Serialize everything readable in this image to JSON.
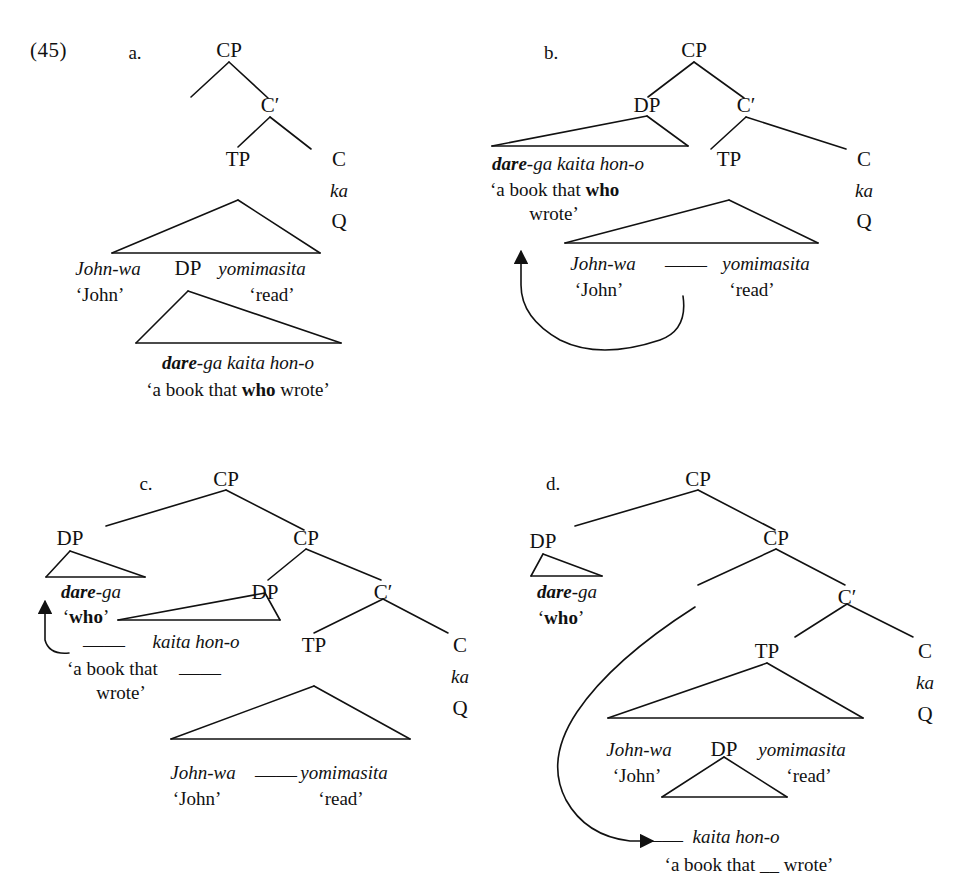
{
  "figure": {
    "number": "(45)",
    "caption_present": false
  },
  "labels": {
    "cp": "CP",
    "cbar": "C′",
    "tp": "TP",
    "c": "C",
    "dp": "DP",
    "ka": "ka",
    "q": "Q",
    "gap": "——"
  },
  "glosses": {
    "john_wa": "John-wa",
    "john": "‘John’",
    "yomimasita": "yomimasita",
    "read": "‘read’",
    "dare_ga_kaita_hon_o": "dare-ga kaita hon-o",
    "dare": "dare",
    "ga_kaita_hon_o": "-ga kaita hon-o",
    "book_that_who_wrote": "‘a book that who wrote’",
    "book_that_who": "‘a book that who",
    "wrote": "wrote’",
    "dare_ga": "-ga",
    "who_q": "‘who’",
    "who": "who",
    "kaita_hon_o": "kaita hon-o",
    "book_that_gap": "‘a book that",
    "gap_wrote": "wrote’",
    "book_that_gap_wrote": "‘a book that __ wrote’"
  },
  "trees": [
    {
      "id": "a",
      "letter": "a.",
      "description": "base structure: wh-phrase in situ inside object DP",
      "nodes": [
        "CP",
        "C′",
        "TP",
        "C",
        "DP"
      ],
      "terminals": [
        "John-wa 'John'",
        "DP",
        "yomimasita 'read'",
        "dare-ga kaita hon-o 'a book that who wrote'",
        "ka",
        "Q"
      ],
      "arrow": false
    },
    {
      "id": "b",
      "letter": "b.",
      "description": "whole object DP scrambled to Spec,CP; gap in TP",
      "nodes": [
        "CP",
        "DP",
        "C′",
        "TP",
        "C"
      ],
      "terminals": [
        "dare-ga kaita hon-o 'a book that who wrote'",
        "John-wa 'John'",
        "__",
        "yomimasita 'read'",
        "ka",
        "Q"
      ],
      "arrow": true,
      "arrow_kind": "curved-up-left"
    },
    {
      "id": "c",
      "letter": "c.",
      "description": "wh-word dare-ga raised out of the scrambled DP to outer Spec,CP",
      "nodes": [
        "CP",
        "DP",
        "CP",
        "DP",
        "C′",
        "TP",
        "C"
      ],
      "terminals": [
        "dare-ga 'who'",
        "__ kaita hon-o 'a book that __ wrote'",
        "John-wa 'John'",
        "__",
        "yomimasita 'read'",
        "ka",
        "Q"
      ],
      "arrow": true,
      "arrow_kind": "short-hook"
    },
    {
      "id": "d",
      "letter": "d.",
      "description": "object DP reconstructed into TP; dare-ga remains in outer Spec,CP",
      "nodes": [
        "CP",
        "DP",
        "CP",
        "C′",
        "TP",
        "C",
        "DP"
      ],
      "terminals": [
        "dare-ga 'who'",
        "John-wa 'John'",
        "DP",
        "yomimasita 'read'",
        "__ kaita hon-o 'a book that __ wrote'",
        "ka",
        "Q"
      ],
      "arrow": true,
      "arrow_kind": "long-sweep-down"
    }
  ],
  "colors": {
    "ink": "#111111",
    "paper": "#ffffff"
  }
}
